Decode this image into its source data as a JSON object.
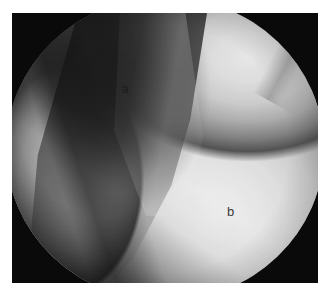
{
  "figure": {
    "kind": "endoscopic-photograph",
    "modality": "arthroscopy",
    "color_mode": "grayscale",
    "frame": {
      "background_color": "#0a0a0a",
      "page_background_color": "#ffffff"
    },
    "field_of_view": {
      "shape": "circle",
      "description": "circular endoscope field of view with dark vignetted rim"
    },
    "annotations": [
      {
        "id": "a",
        "text": "a",
        "color": "#1b1b1b",
        "region": "dark recessed groove, upper-central tissue"
      },
      {
        "id": "b",
        "text": "b",
        "color": "#3a3a3a",
        "region": "bright convex tissue surface, lower-right"
      }
    ]
  }
}
